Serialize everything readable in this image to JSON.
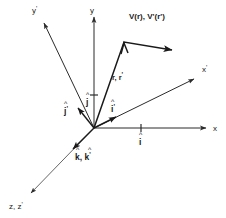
{
  "figure": {
    "background_color": "#ffffff",
    "line_color": "#1a1a1a"
  },
  "axes": [
    {
      "id": "y-prime",
      "label": "y'",
      "base_symbol": "y",
      "prime": "'",
      "label_x": 32,
      "label_y": 13,
      "from": [
        94,
        128
      ],
      "to": [
        41,
        18
      ]
    },
    {
      "id": "y",
      "label": "y",
      "base_symbol": "y",
      "prime": "",
      "label_x": 91,
      "label_y": 13,
      "from": [
        94,
        128
      ],
      "to": [
        94,
        12
      ]
    },
    {
      "id": "x-prime",
      "label": "x'",
      "base_symbol": "x",
      "prime": "'",
      "label_x": 203,
      "label_y": 72,
      "from": [
        94,
        128
      ],
      "to": [
        198,
        77
      ]
    },
    {
      "id": "x",
      "label": "x",
      "base_symbol": "x",
      "prime": "",
      "label_x": 214,
      "label_y": 131,
      "from": [
        94,
        128
      ],
      "to": [
        211,
        128
      ]
    },
    {
      "id": "z-z-prime",
      "label": "z, z'",
      "base_symbol": "z, z",
      "prime": "'",
      "label_x": 10,
      "label_y": 208,
      "from": [
        94,
        128
      ],
      "to": [
        26,
        197
      ]
    }
  ],
  "unit_vectors": [
    {
      "id": "j-prime-hat",
      "label": "j'",
      "symbol": "j",
      "prime": "'",
      "hat": "^",
      "label_x": 65,
      "label_y": 111,
      "from": [
        94,
        128
      ],
      "to": [
        75,
        104
      ]
    },
    {
      "id": "j-hat",
      "label": "j",
      "symbol": "j",
      "prime": "",
      "hat": "^",
      "label_x": 87,
      "label_y": 101,
      "from": [
        94,
        128
      ],
      "to": [
        94,
        95
      ]
    },
    {
      "id": "i-prime-hat",
      "label": "i'",
      "symbol": "i",
      "prime": "'",
      "hat": "^",
      "label_x": 112,
      "label_y": 109,
      "from": [
        94,
        128
      ],
      "to": [
        119,
        116
      ]
    },
    {
      "id": "i-hat",
      "label": "i",
      "symbol": "i",
      "prime": "",
      "hat": "^",
      "label_x": 139,
      "label_y": 142,
      "from": [
        94,
        128
      ],
      "to": [
        141,
        128
      ]
    },
    {
      "id": "k-k-prime-hat",
      "label": "k, k'",
      "symbol": "k, k",
      "prime": "'",
      "hat": "^",
      "label_x": 74,
      "label_y": 158,
      "from": [
        94,
        128
      ],
      "to": [
        70,
        152
      ]
    }
  ],
  "vectors": [
    {
      "id": "position-vector",
      "label": "r, r'",
      "base_symbol": "r, r",
      "prime": "'",
      "label_x": 113,
      "label_y": 79,
      "from": [
        94,
        128
      ],
      "to": [
        124,
        45
      ]
    },
    {
      "id": "field-vector",
      "label": "V(r), V'(r')",
      "label_x": 130,
      "label_y": 18,
      "from": [
        124,
        42
      ],
      "to": [
        178,
        51
      ]
    }
  ],
  "ticks": [
    {
      "id": "x-axis-tick",
      "x": 141,
      "y": 128
    },
    {
      "id": "y-axis-tick",
      "x": 94,
      "y": 95
    }
  ]
}
